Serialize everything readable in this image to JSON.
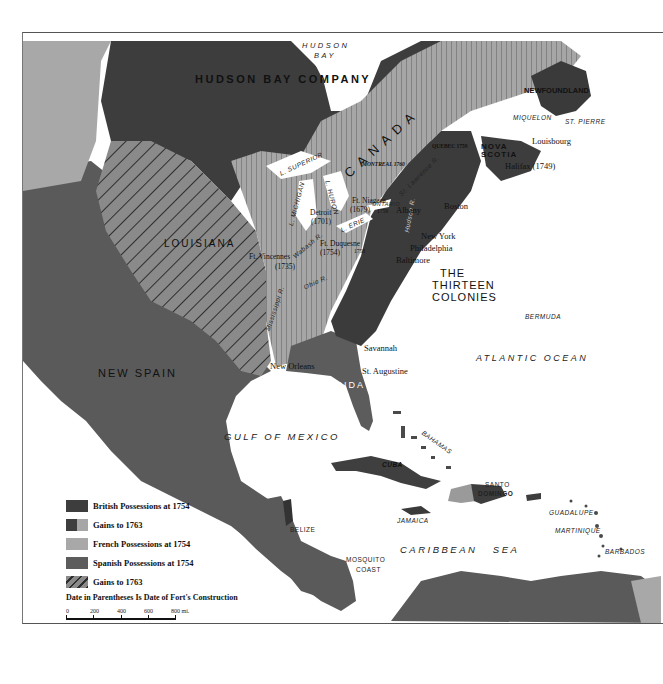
{
  "map": {
    "title_regions": {
      "hudson_bay_company": "HUDSON BAY COMPANY",
      "hudson_bay": "HUDSON BAY",
      "louisiana": "LOUISIANA",
      "new_spain": "NEW SPAIN",
      "canada": "C A N A D A",
      "thirteen_colonies_line1": "THE",
      "thirteen_colonies_line2": "THIRTEEN",
      "thirteen_colonies_line3": "COLONIES",
      "florida": "FLORIDA",
      "nova_scotia": "NOVA SCOTIA",
      "newfoundland": "NEWFOUNDLAND"
    },
    "water": {
      "hudson_bay_line1": "HUDSON",
      "hudson_bay_line2": "BAY",
      "atlantic": "ATLANTIC OCEAN",
      "gulf": "GULF OF MEXICO",
      "caribbean": "CARIBBEAN   SEA",
      "l_superior": "L. SUPERIOR",
      "l_michigan": "L. MICHIGAN",
      "l_huron": "L. HURON",
      "l_erie": "L. ERIE",
      "l_ontario": "ONTARIO",
      "st_lawrence": "St. Lawrence R.",
      "hudson_r": "Hudson R.",
      "wabash_r": "Wabash R.",
      "ohio_r": "Ohio R.",
      "mississippi_r": "Mississippi R."
    },
    "places": {
      "miquelon": "MIQUELON",
      "st_pierre": "ST. PIERRE",
      "louisbourg": "Louisbourg",
      "halifax": "Halifax (1749)",
      "quebec": "QUEBEC 1759",
      "montreal": "MONTREAL 1760",
      "ft_niagara_1": "Ft. Niagara",
      "ft_niagara_2": "(1679)",
      "ft_niagara_year": "1759",
      "albany": "Albany",
      "boston": "Boston",
      "new_york": "New York",
      "philadelphia": "Philadelphia",
      "baltimore": "Baltimore",
      "detroit_1": "Detroit",
      "detroit_2": "(1701)",
      "ft_duquesne_1": "Ft. Duquesne",
      "ft_duquesne_2": "(1754)",
      "ft_duquesne_year": "1758",
      "ft_vincennes_1": "Ft. Vincennes",
      "ft_vincennes_2": "(1735)",
      "savannah": "Savannah",
      "st_augustine": "St. Augustine",
      "new_orleans": "New Orleans",
      "bermuda": "BERMUDA",
      "bahamas": "BAHAMAS",
      "cuba": "CUBA",
      "jamaica": "JAMAICA",
      "santo_domingo_1": "SANTO",
      "santo_domingo_2": "DOMINGO",
      "belize": "BELIZE",
      "mosquito_1": "MOSQUITO",
      "mosquito_2": "COAST",
      "guadalupe": "GUADALUPE",
      "martinique": "MARTINIQUE",
      "barbados": "BARBADOS"
    }
  },
  "legend": {
    "items": [
      {
        "label": "British Possessions at 1754",
        "swatch": "british"
      },
      {
        "label": "Gains to 1763",
        "swatch": "british-gains"
      },
      {
        "label": "French Possessions at 1754",
        "swatch": "french"
      },
      {
        "label": "Spanish Possessions at 1754",
        "swatch": "spanish"
      },
      {
        "label": "Gains to 1763",
        "swatch": "spanish-gains"
      }
    ],
    "note": "Date in Parentheses Is Date of Fort's Construction",
    "scale": {
      "ticks": [
        "0",
        "200",
        "400",
        "600",
        "800 mi."
      ]
    }
  },
  "colors": {
    "british": "#3d3d3d",
    "french": "#a9a9a9",
    "spanish": "#5c5c5c",
    "water": "#ffffff",
    "stripe": "#333333"
  }
}
